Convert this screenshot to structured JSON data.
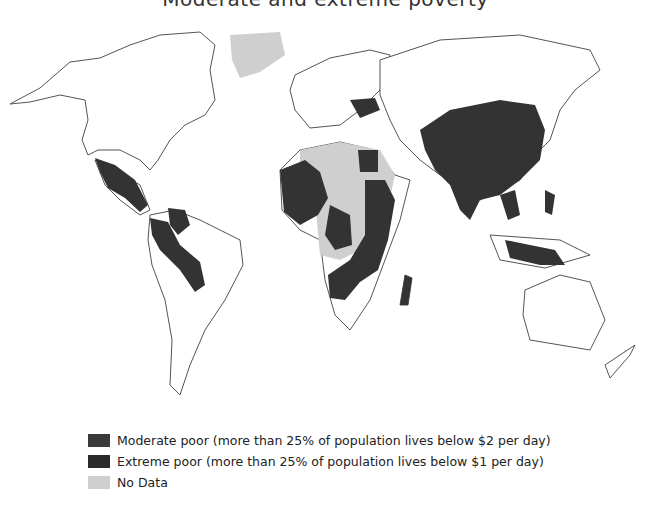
{
  "title": "Moderate and extreme poverty",
  "legend": {
    "items": [
      {
        "label": "Moderate poor (more than 25% of population lives below $2 per day)",
        "color": "#3a3a3a"
      },
      {
        "label": "Extreme poor (more than 25% of population lives below $1 per day)",
        "color": "#2a2a2a"
      },
      {
        "label": "No Data",
        "color": "#cfcfcf"
      }
    ]
  },
  "colors": {
    "land": "#ffffff",
    "outline": "#555555",
    "poor": "#333333",
    "no_data": "#cfcfcf"
  }
}
